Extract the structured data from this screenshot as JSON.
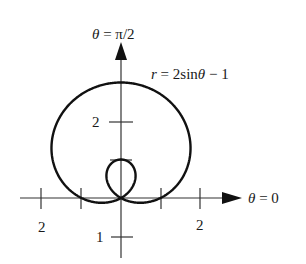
{
  "chart_data": {
    "type": "line",
    "subtype": "polar",
    "equation": "r = 2sinθ − 1",
    "curve_label": {
      "r": "r",
      "eq": " = 2sin",
      "theta": "θ",
      "tail": " − 1"
    },
    "axis_labels": {
      "vertical": {
        "theta": "θ",
        "eq": " = π/2"
      },
      "horizontal": {
        "theta": "θ",
        "eq": " = 0"
      }
    },
    "ticks": {
      "horizontal": [
        {
          "value": -2,
          "label": "2"
        },
        {
          "value": -1,
          "label": ""
        },
        {
          "value": 1,
          "label": ""
        },
        {
          "value": 2,
          "label": "2"
        }
      ],
      "vertical": [
        {
          "value": 2,
          "label": "2"
        },
        {
          "value": 1,
          "label": ""
        },
        {
          "value": -1,
          "label": "1"
        }
      ]
    },
    "curve": "limaçon with inner loop; outer loop reaches r=3 at θ=π/2, inner loop reaches r=1 (at origin-top) at θ=3π/2, passes through origin at θ=π/6 and 5π/6",
    "xlim": [
      -2.1,
      3.5
    ],
    "ylim": [
      -1.6,
      4.0
    ],
    "grid": false
  }
}
